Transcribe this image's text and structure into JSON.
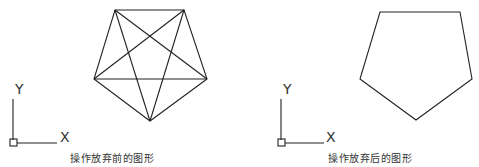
{
  "panels": [
    {
      "id": "before",
      "caption": "操作放弃前的图形",
      "shape": "pentagon-with-diagonals (pentagram inscribed)",
      "axis": {
        "x_label": "X",
        "y_label": "Y"
      }
    },
    {
      "id": "after",
      "caption": "操作放弃后的图形",
      "shape": "pentagon",
      "axis": {
        "x_label": "X",
        "y_label": "Y"
      }
    }
  ],
  "colors": {
    "stroke": "#222222",
    "background": "#ffffff"
  }
}
